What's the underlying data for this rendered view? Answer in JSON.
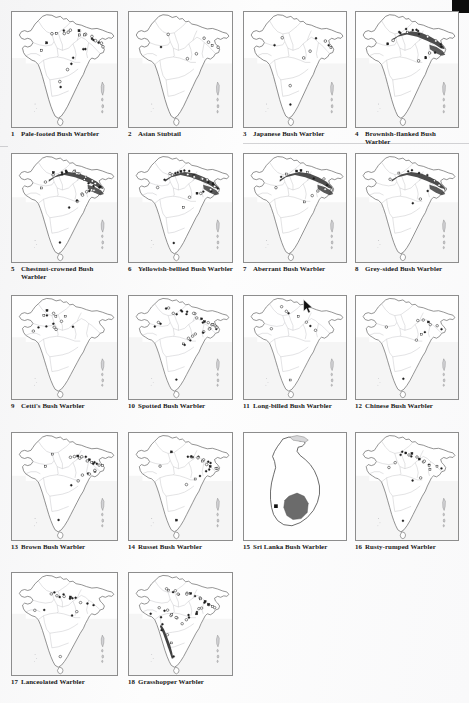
{
  "page": {
    "type": "scanned-book-page",
    "title_implicit": "Distribution maps of bush warblers and allies",
    "columns": 4,
    "rows": 5,
    "total_maps": 18,
    "corner_mark": "black-register-square"
  },
  "colors": {
    "paper": "#fdfdfd",
    "frame_border": "#8d8d8d",
    "country_outline": "#5a5a5a",
    "state_boundary": "#b4b4b4",
    "range_fill_dark": "#3a3a3a",
    "range_fill_grey": "#6f6f6f",
    "sri_lanka_range": "#6b6b6b",
    "text": "#181818"
  },
  "cursor": {
    "name": "mouse-pointer",
    "x": 303,
    "y": 299,
    "over_map": 11
  },
  "maps": [
    {
      "num": "1",
      "name": "Pale-footed Bush Warbler",
      "region": "india",
      "pattern": "scatter-himalaya-ne",
      "points": 26,
      "shade": "none"
    },
    {
      "num": "2",
      "name": "Asian Stubtail",
      "region": "india",
      "pattern": "sparse-ne",
      "points": 8,
      "shade": "none"
    },
    {
      "num": "3",
      "name": "Japanese Bush Warbler",
      "region": "india",
      "pattern": "sparse-ne",
      "points": 10,
      "shade": "none"
    },
    {
      "num": "4",
      "name": "Brownish-flanked Bush Warbler",
      "region": "india",
      "pattern": "himalaya-band-ne",
      "points": 18,
      "shade": "dark"
    },
    {
      "num": "5",
      "name": "Chestnut-crowned Bush Warbler",
      "region": "india",
      "pattern": "himalaya-ne-cluster",
      "points": 30,
      "shade": "dark"
    },
    {
      "num": "6",
      "name": "Yellowish-bellied Bush Warbler",
      "region": "india",
      "pattern": "himalaya-ne-cluster",
      "points": 28,
      "shade": "dark"
    },
    {
      "num": "7",
      "name": "Aberrant Bush Warbler",
      "region": "india",
      "pattern": "himalaya-band-ne",
      "points": 14,
      "shade": "dark"
    },
    {
      "num": "8",
      "name": "Grey-sided Bush Warbler",
      "region": "india",
      "pattern": "himalaya-long-band",
      "points": 12,
      "shade": "dark"
    },
    {
      "num": "9",
      "name": "Cetti's Bush Warbler",
      "region": "india",
      "pattern": "northwest-scatter",
      "points": 14,
      "shade": "none"
    },
    {
      "num": "10",
      "name": "Spotted Bush Warbler",
      "region": "india",
      "pattern": "himalaya-circles",
      "points": 34,
      "shade": "none"
    },
    {
      "num": "11",
      "name": "Long-billed Bush Warbler",
      "region": "india",
      "pattern": "sparse-north",
      "points": 9,
      "shade": "none"
    },
    {
      "num": "12",
      "name": "Chinese Bush Warbler",
      "region": "india",
      "pattern": "ne-cluster",
      "points": 11,
      "shade": "none"
    },
    {
      "num": "13",
      "name": "Brown Bush Warbler",
      "region": "india",
      "pattern": "ne-circles",
      "points": 24,
      "shade": "none"
    },
    {
      "num": "14",
      "name": "Russet Bush Warbler",
      "region": "india",
      "pattern": "ne-circles",
      "points": 22,
      "shade": "none"
    },
    {
      "num": "15",
      "name": "Sri Lanka Bush Warbler",
      "region": "srilanka",
      "pattern": "central-highland-blob",
      "points": 1,
      "shade": "grey-blob"
    },
    {
      "num": "16",
      "name": "Rusty-rumped Warbler",
      "region": "india",
      "pattern": "north-ne-circles",
      "points": 20,
      "shade": "none"
    },
    {
      "num": "17",
      "name": "Lanceolated Warbler",
      "region": "india",
      "pattern": "north-ne-scatter",
      "points": 18,
      "shade": "none"
    },
    {
      "num": "18",
      "name": "Grasshopper Warbler",
      "region": "india",
      "pattern": "wide-scatter-ghats",
      "points": 40,
      "shade": "ghats-band"
    }
  ]
}
